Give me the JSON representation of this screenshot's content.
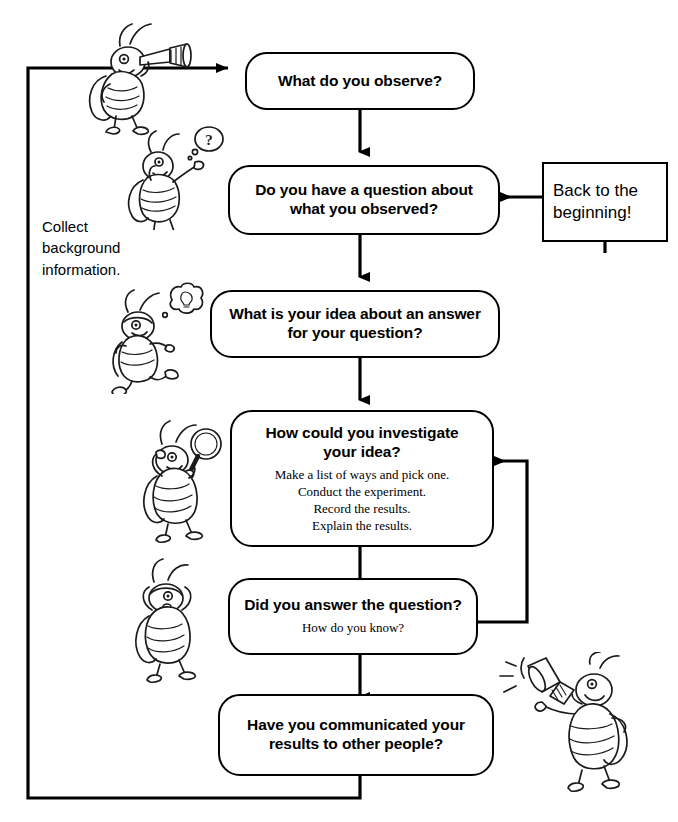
{
  "diagram": {
    "line_color": "#000000",
    "background": "#ffffff",
    "nodes": [
      {
        "id": "observe",
        "shape": "rounded-rect",
        "title": "What do you observe?",
        "sub": ""
      },
      {
        "id": "question",
        "shape": "rounded-rect",
        "title": "Do you have a question about\nwhat you observed?",
        "sub": ""
      },
      {
        "id": "hypothesis",
        "shape": "rounded-rect",
        "title": "What is your idea about an answer\nfor your question?",
        "sub": ""
      },
      {
        "id": "investigate",
        "shape": "rounded-rect",
        "title": "How could you investigate\nyour idea?",
        "sub": "Make a list of ways and pick one.\nConduct the experiment.\nRecord the results.\nExplain the results."
      },
      {
        "id": "answer",
        "shape": "rounded-rect",
        "title": "Did you answer the question?",
        "sub": "How do you know?"
      },
      {
        "id": "communicate",
        "shape": "rounded-rect",
        "title": "Have you communicated your\nresults to other people?",
        "sub": ""
      },
      {
        "id": "restart",
        "shape": "rect",
        "title": "Back to the\nbeginning!",
        "sub": ""
      }
    ],
    "annotations": [
      {
        "id": "collect-background",
        "text": "Collect\nbackground\ninformation."
      }
    ],
    "illustrations": [
      {
        "id": "bug-telescope",
        "name": "insect-with-telescope"
      },
      {
        "id": "bug-question",
        "name": "insect-with-question-mark"
      },
      {
        "id": "bug-idea",
        "name": "insect-running-with-idea-bubble"
      },
      {
        "id": "bug-magnifier",
        "name": "insect-with-magnifying-glass"
      },
      {
        "id": "bug-thinking",
        "name": "insect-standing-thinking"
      },
      {
        "id": "bug-megaphone",
        "name": "insect-with-megaphone"
      }
    ],
    "edges": [
      {
        "from": "observe",
        "to": "question",
        "direction": "down"
      },
      {
        "from": "question",
        "to": "hypothesis",
        "direction": "down"
      },
      {
        "from": "hypothesis",
        "to": "investigate",
        "direction": "down"
      },
      {
        "from": "investigate",
        "to": "answer",
        "direction": "down"
      },
      {
        "from": "answer",
        "to": "communicate",
        "direction": "down"
      },
      {
        "from": "answer",
        "to": "investigate",
        "direction": "loop-right-up"
      },
      {
        "from": "restart",
        "to": "question",
        "direction": "left"
      },
      {
        "from": "communicate",
        "to": "observe",
        "direction": "loop-bottom-left-up"
      }
    ]
  }
}
